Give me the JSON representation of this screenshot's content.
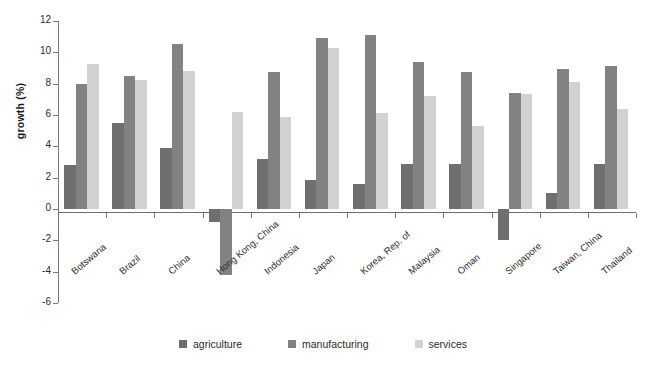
{
  "chart_data": {
    "type": "bar",
    "title": "",
    "subtitle": "",
    "xlabel": "",
    "ylabel": "growth (%)",
    "ylim": [
      -6,
      12
    ],
    "ytick_labels": [
      "12",
      "10",
      "8",
      "6",
      "4",
      "2",
      "0",
      "-2",
      "-4",
      "-6"
    ],
    "ytick_values": [
      12,
      10,
      8,
      6,
      4,
      2,
      0,
      -2,
      -4,
      -6
    ],
    "grid": false,
    "legend_position": "bottom",
    "categories": [
      "Botswana",
      "Brazil",
      "China",
      "Hong Kong, China",
      "Indonesia",
      "Japan",
      "Korea, Rep. of",
      "Malaysia",
      "Oman",
      "Singapore",
      "Taiwan, China",
      "Thailand"
    ],
    "series": [
      {
        "name": "agriculture",
        "color": "#706f70",
        "values": [
          2.8,
          5.5,
          3.9,
          -0.8,
          3.2,
          1.85,
          1.6,
          2.9,
          2.85,
          -2.0,
          1.0,
          2.9
        ]
      },
      {
        "name": "manufacturing",
        "color": "#828282",
        "values": [
          8.0,
          8.5,
          10.55,
          -4.2,
          8.75,
          10.9,
          11.1,
          9.4,
          8.75,
          7.4,
          8.95,
          9.15
        ]
      },
      {
        "name": "services",
        "color": "#d2d2d2",
        "values": [
          9.25,
          8.25,
          8.8,
          6.2,
          5.9,
          10.3,
          6.1,
          7.2,
          5.3,
          7.35,
          8.1,
          6.4
        ]
      }
    ]
  },
  "legend": {
    "items": [
      {
        "label": "agriculture",
        "color": "#706f70"
      },
      {
        "label": "manufacturing",
        "color": "#828282"
      },
      {
        "label": "services",
        "color": "#d2d2d2"
      }
    ]
  }
}
